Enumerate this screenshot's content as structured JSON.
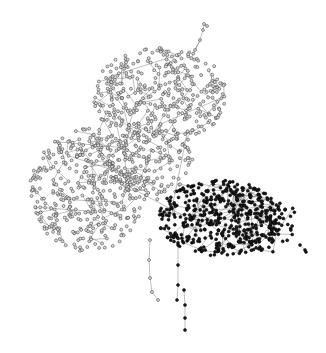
{
  "diagram": {
    "type": "network-graph",
    "width": 326,
    "height": 353,
    "background": "#ffffff",
    "edge_color": "#555555",
    "groups": [
      {
        "name": "light-cluster",
        "node_fill": "#d8d8d8",
        "node_stroke": "#333333",
        "description": "Large dense cluster of hollow/light nodes spanning top and left",
        "regions": [
          {
            "cx": 160,
            "cy": 95,
            "rx": 68,
            "ry": 48,
            "count": 380
          },
          {
            "cx": 88,
            "cy": 190,
            "rx": 58,
            "ry": 62,
            "count": 420
          },
          {
            "cx": 150,
            "cy": 160,
            "rx": 45,
            "ry": 40,
            "count": 160
          }
        ]
      },
      {
        "name": "dark-cluster",
        "node_fill": "#1a1a1a",
        "node_stroke": "#000000",
        "description": "Dense cluster of filled dark nodes at bottom right",
        "regions": [
          {
            "cx": 220,
            "cy": 218,
            "rx": 62,
            "ry": 38,
            "count": 430
          },
          {
            "cx": 265,
            "cy": 225,
            "rx": 35,
            "ry": 28,
            "count": 80
          }
        ]
      }
    ],
    "tendrils": [
      {
        "group": "light-cluster",
        "points": [
          [
            195,
            50
          ],
          [
            200,
            40
          ],
          [
            203,
            30
          ],
          [
            204,
            24
          ],
          [
            207,
            26
          ]
        ]
      },
      {
        "group": "light-cluster",
        "points": [
          [
            150,
            240
          ],
          [
            149,
            260
          ],
          [
            150,
            278
          ],
          [
            152,
            292
          ],
          [
            158,
            300
          ]
        ]
      },
      {
        "group": "dark-cluster",
        "points": [
          [
            178,
            245
          ],
          [
            178,
            265
          ],
          [
            178,
            285
          ],
          [
            177,
            300
          ]
        ]
      },
      {
        "group": "dark-cluster",
        "points": [
          [
            184,
            290
          ],
          [
            185,
            305
          ],
          [
            185,
            318
          ],
          [
            185,
            330
          ]
        ]
      },
      {
        "group": "dark-cluster",
        "points": [
          [
            300,
            245
          ],
          [
            305,
            250
          ],
          [
            306,
            252
          ]
        ]
      }
    ],
    "seed": 17
  }
}
